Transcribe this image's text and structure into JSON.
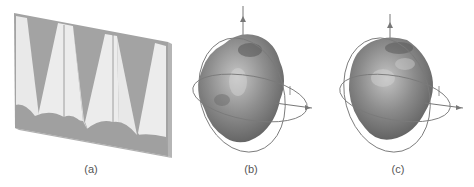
{
  "figure": {
    "panels": [
      {
        "id": "a",
        "caption": "(a)",
        "description": "tapered absorber array on backing plate",
        "caption_x": 91
      },
      {
        "id": "b",
        "caption": "(b)",
        "description": "3D radiation pattern with axis orbit rings",
        "caption_x": 251
      },
      {
        "id": "c",
        "caption": "(c)",
        "description": "3D radiation pattern with axis orbit rings",
        "caption_x": 398
      }
    ],
    "colors": {
      "plate": "#9a9a9a",
      "plate_edge": "#a8a8a8",
      "cone": "#e8e8e8",
      "cone_line": "#888888",
      "blob_dark": "#5a5a5a",
      "blob_mid": "#8c8c8c",
      "blob_light": "#c8c8c8",
      "ring": "#7a7a7a",
      "caption": "#555555"
    }
  }
}
